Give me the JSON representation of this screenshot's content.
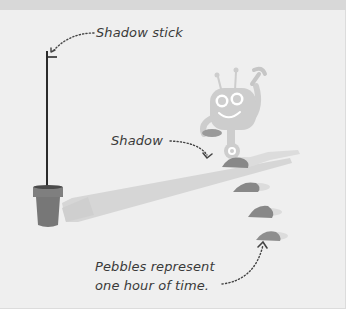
{
  "diagram": {
    "labels": {
      "shadow_stick": "Shadow stick",
      "shadow": "Shadow",
      "shadow_dots": ".....",
      "pebbles_line1": "Pebbles represent",
      "pebbles_line2": "one hour of time.",
      "pebbles_dots": "......"
    },
    "elements": [
      {
        "name": "shadow-stick",
        "description": "vertical stick planted in a flowerpot"
      },
      {
        "name": "flowerpot",
        "description": "grey pot holding the stick"
      },
      {
        "name": "shadow",
        "description": "long thin shadow cast by the stick"
      },
      {
        "name": "robot",
        "description": "friendly robot holding a wrench, placing pebbles"
      },
      {
        "name": "pebbles",
        "count": 4,
        "description": "pebbles marking each hour"
      }
    ],
    "colors": {
      "background": "#efefef",
      "top_band": "#d8d8d8",
      "stick": "#2b2b2b",
      "pot": "#7a7a7a",
      "shadow": "#d4d4d4",
      "robot": "#cfcfcf",
      "pebble": "#8a8a8a",
      "text": "#3a3a3a"
    }
  }
}
